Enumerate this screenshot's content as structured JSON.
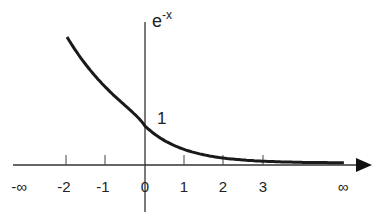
{
  "chart_data": {
    "type": "line",
    "title": "",
    "function_label": "e",
    "function_exponent": "-x",
    "intercept_label": "1",
    "xlabel": "",
    "ylabel": "e^-x",
    "x_ticks": [
      "-∞",
      "-2",
      "-1",
      "0",
      "1",
      "2",
      "3",
      "∞"
    ],
    "xlim": [
      -2,
      5
    ],
    "series": [
      {
        "name": "e^-x",
        "x": [
          -2,
          -1.5,
          -1,
          -0.5,
          0,
          0.5,
          1,
          1.5,
          2,
          2.5,
          3,
          4,
          5
        ],
        "y": [
          7.39,
          4.48,
          2.72,
          1.65,
          1,
          0.61,
          0.37,
          0.22,
          0.14,
          0.08,
          0.05,
          0.02,
          0.01
        ]
      }
    ],
    "grid": false,
    "legend": null
  }
}
